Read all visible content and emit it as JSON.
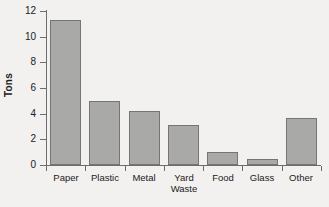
{
  "chart_data": {
    "type": "bar",
    "title": "",
    "xlabel": "",
    "ylabel": "Tons",
    "categories": [
      "Paper",
      "Plastic",
      "Metal",
      "Yard\nWaste",
      "Food",
      "Glass",
      "Other"
    ],
    "values": [
      11.3,
      5.0,
      4.2,
      3.1,
      1.0,
      0.5,
      3.7
    ],
    "ylim": [
      0,
      12
    ],
    "yticks": [
      0,
      2,
      4,
      6,
      8,
      10,
      12
    ],
    "ytick_labels": [
      "0",
      "2",
      "4",
      "6",
      "8",
      "10",
      "12"
    ],
    "grid": false,
    "legend": null,
    "bar_color": "#a9a9a7",
    "bar_edge_color": "#757575",
    "axis_color": "#6d6d6d",
    "background_color": "#f2f1ef",
    "text_color": "#1b1b1b"
  }
}
